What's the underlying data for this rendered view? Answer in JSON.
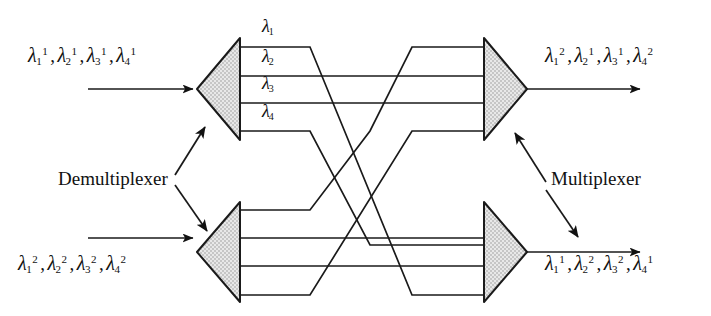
{
  "figure": {
    "background_color": "#ffffff",
    "line_color": "#1a1a1a",
    "device_fill_color": "#d8d8d8",
    "device_stroke_color": "#1a1a1a"
  },
  "captions": {
    "demultiplexer": "Demultiplexer",
    "multiplexer": "Multiplexer"
  },
  "lambda_symbol": "λ",
  "inputs": {
    "top": {
      "name": "input-top",
      "channels": [
        {
          "sub": "1",
          "sup": "1"
        },
        {
          "sub": "2",
          "sup": "1"
        },
        {
          "sub": "3",
          "sup": "1"
        },
        {
          "sub": "4",
          "sup": "1"
        }
      ]
    },
    "bottom": {
      "name": "input-bottom",
      "channels": [
        {
          "sub": "1",
          "sup": "2"
        },
        {
          "sub": "2",
          "sup": "2"
        },
        {
          "sub": "3",
          "sup": "2"
        },
        {
          "sub": "4",
          "sup": "2"
        }
      ]
    }
  },
  "outputs": {
    "top": {
      "name": "output-top",
      "channels": [
        {
          "sub": "1",
          "sup": "2"
        },
        {
          "sub": "2",
          "sup": "1"
        },
        {
          "sub": "3",
          "sup": "1"
        },
        {
          "sub": "4",
          "sup": "2"
        }
      ]
    },
    "bottom": {
      "name": "output-bottom",
      "channels": [
        {
          "sub": "1",
          "sup": "1"
        },
        {
          "sub": "2",
          "sup": "2"
        },
        {
          "sub": "3",
          "sup": "2"
        },
        {
          "sub": "4",
          "sup": "1"
        }
      ]
    }
  },
  "inner_channel_labels": [
    {
      "sub": "1"
    },
    {
      "sub": "2"
    },
    {
      "sub": "3"
    },
    {
      "sub": "4"
    }
  ],
  "routing": {
    "description": "Wavelengths 1 and 4 are exchanged between the two paths; wavelengths 2 and 3 pass straight through.",
    "top_path": [
      {
        "channel": "1",
        "from": "demux-top",
        "to": "mux-bottom",
        "crossed": true
      },
      {
        "channel": "2",
        "from": "demux-top",
        "to": "mux-top",
        "crossed": false
      },
      {
        "channel": "3",
        "from": "demux-top",
        "to": "mux-top",
        "crossed": false
      },
      {
        "channel": "4",
        "from": "demux-top",
        "to": "mux-bottom",
        "crossed": true
      }
    ],
    "bottom_path": [
      {
        "channel": "1",
        "from": "demux-bottom",
        "to": "mux-top",
        "crossed": true
      },
      {
        "channel": "2",
        "from": "demux-bottom",
        "to": "mux-bottom",
        "crossed": false
      },
      {
        "channel": "3",
        "from": "demux-bottom",
        "to": "mux-bottom",
        "crossed": false
      },
      {
        "channel": "4",
        "from": "demux-bottom",
        "to": "mux-top",
        "crossed": true
      }
    ]
  }
}
